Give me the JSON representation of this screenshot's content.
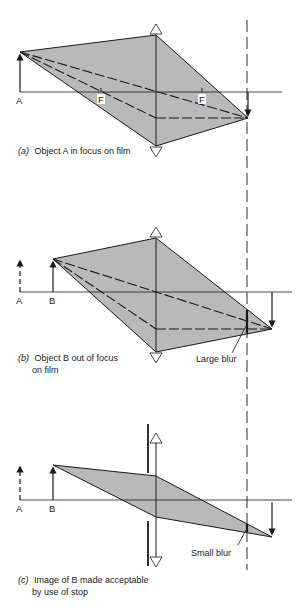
{
  "colors": {
    "ink": "#1a1a1a",
    "fill": "#b9b9b9",
    "background": "#ffffff"
  },
  "panels": [
    {
      "id": "a",
      "caption_letter": "(a)",
      "caption_lines": [
        "Object A in focus on film"
      ],
      "labels": {
        "object_a": "A",
        "focal_left": "F",
        "focal_right": "F"
      }
    },
    {
      "id": "b",
      "caption_letter": "(b)",
      "caption_lines": [
        "Object B out of focus",
        "on film"
      ],
      "labels": {
        "object_a": "A",
        "object_b": "B",
        "blur": "Large blur"
      }
    },
    {
      "id": "c",
      "caption_letter": "(c)",
      "caption_lines": [
        "Image of B made acceptable",
        "by use of stop"
      ],
      "labels": {
        "object_a": "A",
        "object_b": "B",
        "blur": "Small blur"
      }
    }
  ]
}
